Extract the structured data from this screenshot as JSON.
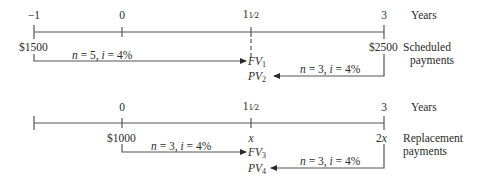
{
  "top_timeline": {
    "ticks": [
      {
        "label": "−1",
        "x": 34
      },
      {
        "label": "0",
        "x": 122
      },
      {
        "label_whole": "1",
        "label_frac": "1⁄2",
        "x": 251
      },
      {
        "label": "3",
        "x": 384
      }
    ],
    "axis_unit": "Years",
    "amounts": {
      "left": "$1500",
      "right": "$2500"
    },
    "row_label_line1": "Scheduled",
    "row_label_line2": "payments",
    "arrow_forward": {
      "label_n": "n",
      "label_eq": " = 5, ",
      "label_i": "i",
      "label_rate": " = 4%"
    },
    "arrow_back": {
      "label_n": "n",
      "label_eq": " = 3, ",
      "label_i": "i",
      "label_rate": " = 4%"
    },
    "fv": {
      "symbol": "FV",
      "sub": "1"
    },
    "pv": {
      "symbol": "PV",
      "sub": "2"
    }
  },
  "bottom_timeline": {
    "ticks": [
      {
        "label": "0",
        "x": 122
      },
      {
        "label_whole": "1",
        "label_frac": "1⁄2",
        "x": 251
      },
      {
        "label": "3",
        "x": 384
      }
    ],
    "axis_unit": "Years",
    "amounts": {
      "left": "$1000",
      "middle": "x",
      "right_coef": "2",
      "right_var": "x"
    },
    "row_label_line1": "Replacement",
    "row_label_line2": "payments",
    "arrow_forward": {
      "label_n": "n",
      "label_eq": " = 3, ",
      "label_i": "i",
      "label_rate": " = 4%"
    },
    "arrow_back": {
      "label_n": "n",
      "label_eq": " = 3, ",
      "label_i": "i",
      "label_rate": " = 4%"
    },
    "fv": {
      "symbol": "FV",
      "sub": "3"
    },
    "pv": {
      "symbol": "PV",
      "sub": "4"
    }
  }
}
